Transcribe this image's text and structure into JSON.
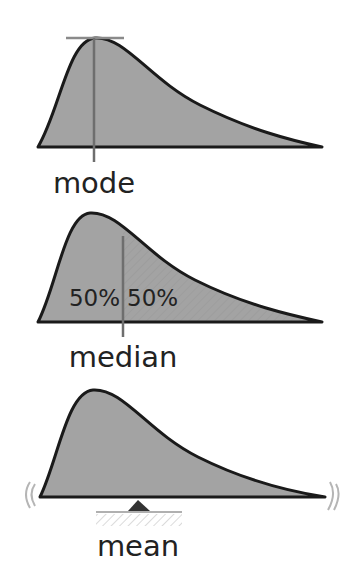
{
  "panels": [
    {
      "id": "mode",
      "label": "mode"
    },
    {
      "id": "median",
      "label": "median",
      "left_pct": "50%",
      "right_pct": "50%"
    },
    {
      "id": "mean",
      "label": "mean"
    }
  ],
  "colors": {
    "fill": "#a3a3a3",
    "outline": "#1a1a1a",
    "marker": "#7a7a7a",
    "label": "#222222"
  }
}
